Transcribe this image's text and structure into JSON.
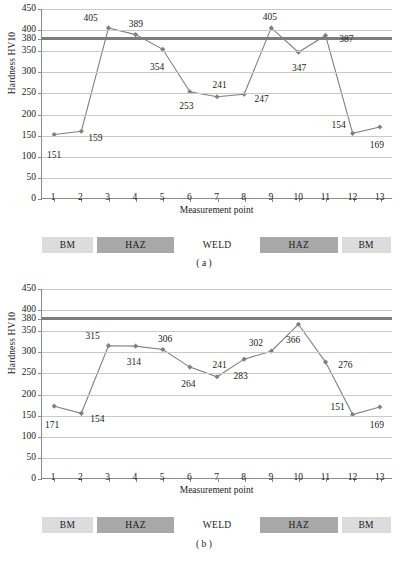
{
  "chart_data": [
    {
      "type": "line",
      "panel_label": "( a )",
      "title": "",
      "xlabel": "Measurement point",
      "ylabel": "Hardness HV10",
      "x": [
        1,
        2,
        3,
        4,
        5,
        6,
        7,
        8,
        9,
        10,
        11,
        12,
        13
      ],
      "xtick_labels": [
        "1",
        "2",
        "3",
        "4",
        "5",
        "6",
        "7",
        "8",
        "9",
        "10",
        "11",
        "12",
        "13"
      ],
      "values": [
        151,
        159,
        405,
        389,
        354,
        253,
        241,
        247,
        405,
        347,
        387,
        154,
        169
      ],
      "data_labels": [
        "151",
        "159",
        "405",
        "389",
        "354",
        "253",
        "241",
        "247",
        "405",
        "347",
        "387",
        "154",
        "169"
      ],
      "ylim": [
        0,
        450
      ],
      "yticks": [
        0,
        50,
        100,
        150,
        200,
        250,
        300,
        350,
        380,
        400,
        450
      ],
      "ytick_labels": [
        "0",
        "50",
        "100",
        "150",
        "200",
        "250",
        "300",
        "350",
        "380",
        "400",
        "450"
      ],
      "reference_line": 380,
      "grid": true,
      "legend": "none",
      "series_color": "#808080",
      "marker": "diamond",
      "zones": [
        {
          "label": "BM",
          "from": 0.6,
          "to": 2.45,
          "style": "bm"
        },
        {
          "label": "HAZ",
          "from": 2.6,
          "to": 5.45,
          "style": "haz"
        },
        {
          "label": "WELD",
          "from": 5.6,
          "to": 8.45,
          "style": "weld"
        },
        {
          "label": "HAZ",
          "from": 8.6,
          "to": 11.45,
          "style": "haz"
        },
        {
          "label": "BM",
          "from": 11.6,
          "to": 13.4,
          "style": "bm"
        }
      ],
      "label_offsets": [
        {
          "dx": 0,
          "dy": 20
        },
        {
          "dx": 14,
          "dy": 6
        },
        {
          "dx": -18,
          "dy": -10
        },
        {
          "dx": 0,
          "dy": -11
        },
        {
          "dx": -6,
          "dy": 17
        },
        {
          "dx": -4,
          "dy": 14
        },
        {
          "dx": 2,
          "dy": -12
        },
        {
          "dx": 17,
          "dy": 4
        },
        {
          "dx": -2,
          "dy": -11
        },
        {
          "dx": 0,
          "dy": 16
        },
        {
          "dx": 20,
          "dy": 3
        },
        {
          "dx": -15,
          "dy": -9
        },
        {
          "dx": -4,
          "dy": 17
        }
      ]
    },
    {
      "type": "line",
      "panel_label": "( b )",
      "title": "",
      "xlabel": "Measurement point",
      "ylabel": "Hardness HV10",
      "x": [
        1,
        2,
        3,
        4,
        5,
        6,
        7,
        8,
        9,
        10,
        11,
        12,
        13
      ],
      "xtick_labels": [
        "1",
        "2",
        "3",
        "4",
        "5",
        "6",
        "7",
        "8",
        "9",
        "10",
        "11",
        "12",
        "13"
      ],
      "values": [
        171,
        154,
        315,
        314,
        306,
        264,
        241,
        283,
        302,
        366,
        276,
        151,
        169
      ],
      "data_labels": [
        "171",
        "154",
        "315",
        "314",
        "306",
        "264",
        "241",
        "283",
        "302",
        "366",
        "276",
        "151",
        "169"
      ],
      "ylim": [
        0,
        450
      ],
      "yticks": [
        0,
        50,
        100,
        150,
        200,
        250,
        300,
        350,
        380,
        400,
        450
      ],
      "ytick_labels": [
        "0",
        "50",
        "100",
        "150",
        "200",
        "250",
        "300",
        "350",
        "380",
        "400",
        "450"
      ],
      "reference_line": 380,
      "grid": true,
      "legend": "none",
      "series_color": "#808080",
      "marker": "diamond",
      "zones": [
        {
          "label": "BM",
          "from": 0.6,
          "to": 2.45,
          "style": "bm"
        },
        {
          "label": "HAZ",
          "from": 2.6,
          "to": 5.45,
          "style": "haz"
        },
        {
          "label": "WELD",
          "from": 5.6,
          "to": 8.45,
          "style": "weld"
        },
        {
          "label": "HAZ",
          "from": 8.6,
          "to": 11.45,
          "style": "haz"
        },
        {
          "label": "BM",
          "from": 11.6,
          "to": 13.4,
          "style": "bm"
        }
      ],
      "label_offsets": [
        {
          "dx": -2,
          "dy": 18
        },
        {
          "dx": 16,
          "dy": 5
        },
        {
          "dx": -16,
          "dy": -10
        },
        {
          "dx": -2,
          "dy": 16
        },
        {
          "dx": 2,
          "dy": -11
        },
        {
          "dx": -2,
          "dy": 16
        },
        {
          "dx": 2,
          "dy": -12
        },
        {
          "dx": -4,
          "dy": 16
        },
        {
          "dx": -16,
          "dy": -8
        },
        {
          "dx": -6,
          "dy": 16
        },
        {
          "dx": 19,
          "dy": 3
        },
        {
          "dx": -16,
          "dy": -8
        },
        {
          "dx": -4,
          "dy": 17
        }
      ]
    }
  ],
  "colors": {
    "series": "#808080",
    "reference_line": "#7d7d7d",
    "gridline": "#c9c9c9",
    "axis": "#8b8b8b",
    "zone_bm": "#dcdcdc",
    "zone_haz": "#a8a8a8",
    "text": "#1a1a1a"
  }
}
